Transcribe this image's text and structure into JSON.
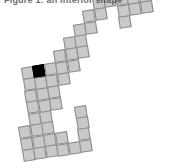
{
  "figure": {
    "caption": "Figure 1: an interior shape",
    "background_color": "#ffffff",
    "width": 170,
    "height": 168
  },
  "chart_data": {
    "type": "heatmap",
    "title": "",
    "subtitle": "",
    "xlabel": "",
    "ylabel": "",
    "grid": true,
    "legend_position": "none",
    "cell_size_px": 11.6,
    "rotation_degrees": -9,
    "origin_px": {
      "x": 22,
      "y": 150
    },
    "colors": {
      "cell_fill": "#c9c9c9",
      "cell_border": "#8a8a8a",
      "highlight_fill": "#000000",
      "background": "#ffffff"
    },
    "categories": [
      "col",
      "row"
    ],
    "axis_ranges": {
      "col": [
        0,
        12
      ],
      "row": [
        0,
        12
      ]
    },
    "values": [
      1,
      0
    ],
    "legend": [
      {
        "label": "region cell",
        "color": "#c9c9c9"
      },
      {
        "label": "marked cell",
        "color": "#000000"
      }
    ],
    "highlight_cell": {
      "col": 2,
      "row": 7
    },
    "cell_count": 56,
    "highlight_count": 1,
    "cells": [
      {
        "col": 0,
        "row": 0,
        "state": "fill"
      },
      {
        "col": 1,
        "row": 0,
        "state": "fill"
      },
      {
        "col": 2,
        "row": 0,
        "state": "fill"
      },
      {
        "col": 3,
        "row": 0,
        "state": "fill"
      },
      {
        "col": 4,
        "row": 0,
        "state": "fill"
      },
      {
        "col": 5,
        "row": 0,
        "state": "fill"
      },
      {
        "col": 5,
        "row": 1,
        "state": "fill"
      },
      {
        "col": 0,
        "row": 1,
        "state": "fill"
      },
      {
        "col": 1,
        "row": 1,
        "state": "fill"
      },
      {
        "col": 2,
        "row": 1,
        "state": "fill"
      },
      {
        "col": 3,
        "row": 1,
        "state": "fill"
      },
      {
        "col": 0,
        "row": 2,
        "state": "fill"
      },
      {
        "col": 1,
        "row": 2,
        "state": "fill"
      },
      {
        "col": 2,
        "row": 2,
        "state": "fill"
      },
      {
        "col": 1,
        "row": 3,
        "state": "fill"
      },
      {
        "col": 2,
        "row": 3,
        "state": "fill"
      },
      {
        "col": 1,
        "row": 4,
        "state": "fill"
      },
      {
        "col": 2,
        "row": 4,
        "state": "fill"
      },
      {
        "col": 3,
        "row": 4,
        "state": "fill"
      },
      {
        "col": 1,
        "row": 5,
        "state": "fill"
      },
      {
        "col": 2,
        "row": 5,
        "state": "fill"
      },
      {
        "col": 3,
        "row": 5,
        "state": "fill"
      },
      {
        "col": 1,
        "row": 6,
        "state": "fill"
      },
      {
        "col": 2,
        "row": 6,
        "state": "fill"
      },
      {
        "col": 3,
        "row": 6,
        "state": "fill"
      },
      {
        "col": 4,
        "row": 6,
        "state": "fill"
      },
      {
        "col": 1,
        "row": 7,
        "state": "fill"
      },
      {
        "col": 2,
        "row": 7,
        "state": "dark"
      },
      {
        "col": 3,
        "row": 7,
        "state": "fill"
      },
      {
        "col": 4,
        "row": 7,
        "state": "fill"
      },
      {
        "col": 5,
        "row": 7,
        "state": "fill"
      },
      {
        "col": 4,
        "row": 8,
        "state": "fill"
      },
      {
        "col": 5,
        "row": 8,
        "state": "fill"
      },
      {
        "col": 6,
        "row": 8,
        "state": "fill"
      },
      {
        "col": 5,
        "row": 9,
        "state": "fill"
      },
      {
        "col": 6,
        "row": 9,
        "state": "fill"
      },
      {
        "col": 6,
        "row": 10,
        "state": "fill"
      },
      {
        "col": 7,
        "row": 10,
        "state": "fill"
      },
      {
        "col": 7,
        "row": 11,
        "state": "fill"
      },
      {
        "col": 8,
        "row": 11,
        "state": "fill"
      },
      {
        "col": 8,
        "row": 12,
        "state": "fill"
      },
      {
        "col": 9,
        "row": 12,
        "state": "fill"
      },
      {
        "col": 10,
        "row": 12,
        "state": "fill"
      },
      {
        "col": 10,
        "row": 11,
        "state": "fill"
      },
      {
        "col": 10,
        "row": 10,
        "state": "fill"
      },
      {
        "col": 11,
        "row": 12,
        "state": "fill"
      },
      {
        "col": 11,
        "row": 13,
        "state": "fill"
      },
      {
        "col": 12,
        "row": 13,
        "state": "fill"
      },
      {
        "col": 13,
        "row": 13,
        "state": "fill"
      },
      {
        "col": 11,
        "row": 11,
        "state": "fill"
      },
      {
        "col": 12,
        "row": 12,
        "state": "fill"
      },
      {
        "col": 5,
        "row": 2,
        "state": "fill"
      },
      {
        "col": 5,
        "row": 3,
        "state": "fill"
      },
      {
        "col": 9,
        "row": 13,
        "state": "fill"
      },
      {
        "col": 10,
        "row": 13,
        "state": "fill"
      },
      {
        "col": 12,
        "row": 11,
        "state": "fill"
      }
    ]
  }
}
